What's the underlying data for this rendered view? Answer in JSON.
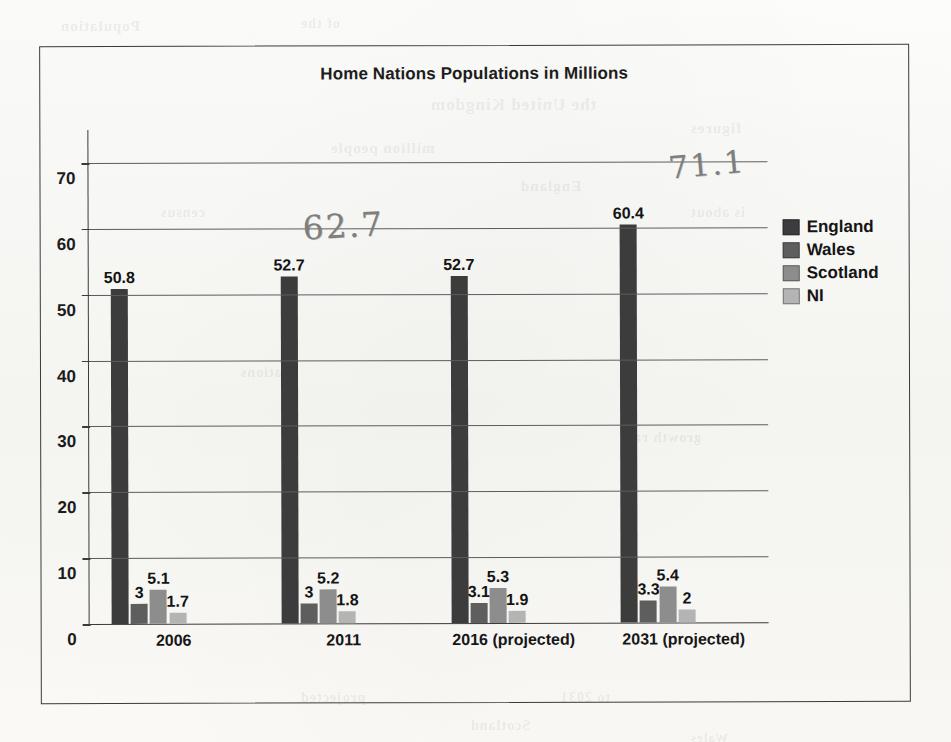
{
  "chart_data": {
    "type": "bar",
    "title": "Home Nations Populations in Millions",
    "xlabel": "",
    "ylabel": "",
    "ylim": [
      0,
      75
    ],
    "ytick_values": [
      0,
      10,
      20,
      30,
      40,
      50,
      60,
      70
    ],
    "ytick_labels": [
      "0",
      "10",
      "20",
      "30",
      "40",
      "50",
      "60",
      "70"
    ],
    "grid": true,
    "legend_position": "right",
    "categories": [
      "2006",
      "2011",
      "2016 (projected)",
      "2031 (projected)"
    ],
    "series": [
      {
        "name": "England",
        "color": "#3c3c3c",
        "values": [
          50.8,
          52.7,
          52.7,
          60.4
        ],
        "labels": [
          "50.8",
          "52.7",
          "52.7",
          "60.4"
        ]
      },
      {
        "name": "Wales",
        "color": "#5e5e5e",
        "values": [
          3,
          3,
          3.1,
          3.3
        ],
        "labels": [
          "3",
          "3",
          "3.1",
          "3.3"
        ]
      },
      {
        "name": "Scotland",
        "color": "#8d8d8d",
        "values": [
          5.1,
          5.2,
          5.3,
          5.4
        ],
        "labels": [
          "5.1",
          "5.2",
          "5.3",
          "5.4"
        ]
      },
      {
        "name": "NI",
        "color": "#b4b4b4",
        "values": [
          1.7,
          1.8,
          1.9,
          2
        ],
        "labels": [
          "1.7",
          "1.8",
          "1.9",
          "2"
        ]
      }
    ],
    "annotations": [
      {
        "text": "62.7",
        "kind": "handwritten-pencil"
      },
      {
        "text": "71.1",
        "kind": "handwritten-pencil"
      }
    ]
  },
  "legend": {
    "items": [
      {
        "label": "England",
        "color": "#3c3c3c"
      },
      {
        "label": "Wales",
        "color": "#5e5e5e"
      },
      {
        "label": "Scotland",
        "color": "#8d8d8d"
      },
      {
        "label": "NI",
        "color": "#b4b4b4"
      }
    ]
  },
  "bleed_through": [
    {
      "text": "Population",
      "x": 60,
      "y": 18,
      "size": 15
    },
    {
      "text": "of the",
      "x": 300,
      "y": 16,
      "size": 14
    },
    {
      "text": "the United Kingdom",
      "x": 430,
      "y": 95,
      "size": 17
    },
    {
      "text": "million people",
      "x": 330,
      "y": 140,
      "size": 15
    },
    {
      "text": "figures",
      "x": 690,
      "y": 120,
      "size": 15
    },
    {
      "text": "census",
      "x": 160,
      "y": 205,
      "size": 14
    },
    {
      "text": "England",
      "x": 520,
      "y": 178,
      "size": 15
    },
    {
      "text": "is about",
      "x": 690,
      "y": 205,
      "size": 14
    },
    {
      "text": "nations",
      "x": 240,
      "y": 365,
      "size": 14
    },
    {
      "text": "growth rate",
      "x": 620,
      "y": 430,
      "size": 14
    },
    {
      "text": "projected",
      "x": 300,
      "y": 690,
      "size": 14
    },
    {
      "text": "to 2031",
      "x": 560,
      "y": 690,
      "size": 14
    },
    {
      "text": "Scotland",
      "x": 470,
      "y": 718,
      "size": 14
    },
    {
      "text": "Wales",
      "x": 690,
      "y": 730,
      "size": 13
    }
  ]
}
